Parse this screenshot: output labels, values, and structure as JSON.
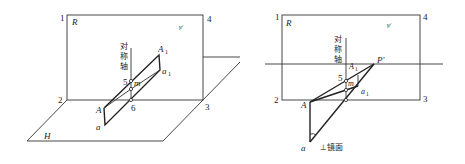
{
  "left_figure": {
    "plane_R_label": "R",
    "plane_H_label": "H",
    "corner_labels": [
      "1",
      "2",
      "3",
      "4"
    ],
    "gamma_mark": "γ/",
    "axis_label_chars": [
      "对",
      "称",
      "轴"
    ],
    "point_labels": {
      "A1": "A",
      "A1_sub": "1",
      "a1": "a",
      "a1_sub": "1",
      "A": "A",
      "a": "a",
      "m": "m",
      "p5": "5",
      "p6": "6"
    }
  },
  "right_figure": {
    "plane_R_label": "R",
    "corner_labels": [
      "1",
      "2",
      "3",
      "4"
    ],
    "gamma_mark": "γ/",
    "axis_label_chars": [
      "对",
      "称",
      "轴"
    ],
    "point_labels": {
      "P_prime": "P′",
      "A1": "A",
      "A1_sub": "1",
      "a1": "a",
      "a1_sub": "1",
      "A": "A",
      "a": "a",
      "m": "m",
      "p5": "5"
    },
    "perp_mirror_label": "⊥镜面"
  }
}
